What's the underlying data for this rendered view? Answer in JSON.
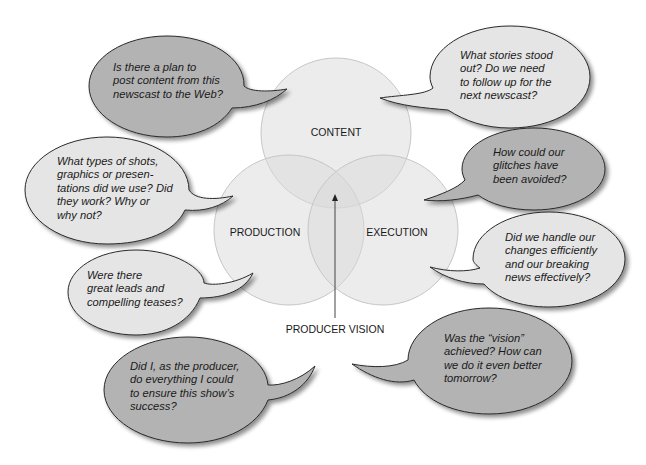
{
  "diagram": {
    "circles": [
      {
        "id": "content",
        "label": "CONTENT"
      },
      {
        "id": "production",
        "label": "PRODUCTION"
      },
      {
        "id": "execution",
        "label": "EXECUTION"
      }
    ],
    "center_label": "PRODUCER VISION",
    "colors": {
      "circle_fill": "#ececec",
      "circle_stroke": "#c9c9c9",
      "bubble_dark": "#b3b3b3",
      "bubble_light": "#e5e5e5",
      "bubble_stroke": "#2a2a2a"
    }
  },
  "bubbles": [
    {
      "id": "web-plan",
      "shade": "dark",
      "lines": [
        "Is there a plan to",
        "post content from this",
        "newscast to the Web?"
      ]
    },
    {
      "id": "shots-graphics",
      "shade": "light",
      "lines": [
        "What types of shots,",
        "graphics or presen-",
        "tations did we use? Did",
        "they work? Why or",
        "why not?"
      ]
    },
    {
      "id": "leads-teases",
      "shade": "light",
      "lines": [
        "Were there",
        "great leads and",
        "compelling teases?"
      ]
    },
    {
      "id": "producer-effort",
      "shade": "dark",
      "lines": [
        "Did I, as the producer,",
        "do everything I could",
        "to ensure this show’s",
        "success?"
      ]
    },
    {
      "id": "stories-stood-out",
      "shade": "light",
      "lines": [
        "What stories stood",
        "out? Do we need",
        "to follow up for the",
        "next newscast?"
      ]
    },
    {
      "id": "glitches",
      "shade": "dark",
      "lines": [
        "How could our",
        "glitches have",
        "been avoided?"
      ]
    },
    {
      "id": "changes-breaking-news",
      "shade": "light",
      "lines": [
        "Did we handle our",
        "changes efficiently",
        "and our breaking",
        "news effectively?"
      ]
    },
    {
      "id": "vision-achieved",
      "shade": "dark",
      "lines": [
        "Was the “vision”",
        "achieved? How can",
        "we do it even better",
        "tomorrow?"
      ]
    }
  ]
}
